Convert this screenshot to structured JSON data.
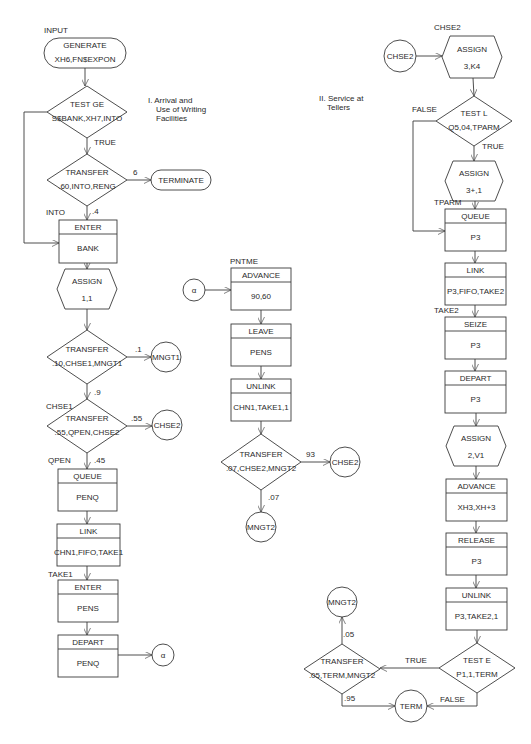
{
  "diagram": {
    "section_labels": [
      {
        "id": "sec1",
        "x": 148,
        "y": 103,
        "lines": [
          "I.  Arrival and",
          "Use of Writing",
          "Facilities"
        ]
      },
      {
        "id": "sec2",
        "x": 319,
        "y": 101,
        "lines": [
          "II.  Service at",
          "Tellers"
        ]
      }
    ],
    "block_labels": [
      {
        "text": "INPUT",
        "x": 44,
        "y": 33
      },
      {
        "text": "INTO",
        "x": 46,
        "y": 215
      },
      {
        "text": "CHSE1",
        "x": 46,
        "y": 409
      },
      {
        "text": "QPEN",
        "x": 48,
        "y": 463
      },
      {
        "text": "TAKE1",
        "x": 48,
        "y": 577
      },
      {
        "text": "PNTME",
        "x": 230,
        "y": 264
      },
      {
        "text": "CHSE2",
        "x": 434,
        "y": 30
      },
      {
        "text": "TPARM",
        "x": 434,
        "y": 205
      },
      {
        "text": "TAKE2",
        "x": 434,
        "y": 313
      }
    ],
    "nodes": [
      {
        "id": "generate",
        "type": "terminal",
        "x": 44,
        "y": 38,
        "w": 82,
        "h": 30,
        "title": "GENERATE",
        "operand": "XH6,FN$EXPON"
      },
      {
        "id": "testge",
        "type": "decision",
        "cx": 87,
        "cy": 112,
        "w": 80,
        "h": 52,
        "title": "TEST GE",
        "operand": "S$BANK,XH7,INTO"
      },
      {
        "id": "transfer1",
        "type": "decision",
        "cx": 87,
        "cy": 180,
        "w": 80,
        "h": 52,
        "title": "TRANSFER",
        "operand": ".60,INTO,RENG"
      },
      {
        "id": "terminate",
        "type": "terminal",
        "x": 151,
        "y": 170,
        "w": 60,
        "h": 20,
        "title": "TERMINATE",
        "operand": ""
      },
      {
        "id": "enter_bank",
        "type": "block",
        "x": 59,
        "y": 220,
        "w": 58,
        "h": 43,
        "title": "ENTER",
        "operand": "BANK"
      },
      {
        "id": "assign11",
        "type": "hexagon",
        "cx": 87,
        "cy": 289,
        "w": 60,
        "h": 40,
        "title": "ASSIGN",
        "operand": "1,1"
      },
      {
        "id": "transfer2",
        "type": "decision",
        "cx": 87,
        "cy": 357,
        "w": 80,
        "h": 54,
        "title": "TRANSFER",
        "operand": ".10,CHSE1,MNGT1"
      },
      {
        "id": "mngt1",
        "type": "connector",
        "cx": 166,
        "cy": 357,
        "r": 15,
        "title": "MNGT1"
      },
      {
        "id": "transfer3",
        "type": "decision",
        "cx": 87,
        "cy": 426,
        "w": 80,
        "h": 54,
        "title": "TRANSFER",
        "operand": ".55,QPEN,CHSE2"
      },
      {
        "id": "chse2_a",
        "type": "connector",
        "cx": 167,
        "cy": 425,
        "r": 15,
        "title": "CHSE2"
      },
      {
        "id": "queue_penq",
        "type": "block",
        "x": 58,
        "y": 469,
        "w": 59,
        "h": 42,
        "title": "QUEUE",
        "operand": "PENQ"
      },
      {
        "id": "link1",
        "type": "block",
        "x": 57,
        "y": 524,
        "w": 63,
        "h": 42,
        "title": "LINK",
        "operand": "CHN1,FIFO,TAKE1"
      },
      {
        "id": "enter_pens",
        "type": "block",
        "x": 58,
        "y": 580,
        "w": 60,
        "h": 42,
        "title": "ENTER",
        "operand": "PENS"
      },
      {
        "id": "depart_penq",
        "type": "block",
        "x": 58,
        "y": 635,
        "w": 60,
        "h": 42,
        "title": "DEPART",
        "operand": "PENQ"
      },
      {
        "id": "alpha_out",
        "type": "connector",
        "cx": 163,
        "cy": 655,
        "r": 11,
        "title": "α"
      },
      {
        "id": "alpha_in",
        "type": "connector",
        "cx": 194,
        "cy": 290,
        "r": 11,
        "title": "α"
      },
      {
        "id": "advance1",
        "type": "block",
        "x": 231,
        "y": 268,
        "w": 60,
        "h": 42,
        "title": "ADVANCE",
        "operand": "90,60"
      },
      {
        "id": "leave",
        "type": "block",
        "x": 231,
        "y": 324,
        "w": 60,
        "h": 42,
        "title": "LEAVE",
        "operand": "PENS"
      },
      {
        "id": "unlink1",
        "type": "block",
        "x": 231,
        "y": 379,
        "w": 60,
        "h": 42,
        "title": "UNLINK",
        "operand": "CHN1,TAKE1,1"
      },
      {
        "id": "transfer4",
        "type": "decision",
        "cx": 261,
        "cy": 462,
        "w": 80,
        "h": 56,
        "title": "TRANSFER",
        "operand": ".07,CHSE2,MNGT2"
      },
      {
        "id": "chse2_b",
        "type": "connector",
        "cx": 345,
        "cy": 462,
        "r": 15,
        "title": "CHSE2"
      },
      {
        "id": "mngt2_a",
        "type": "connector",
        "cx": 261,
        "cy": 527,
        "r": 15,
        "title": "MNGT2"
      },
      {
        "id": "chse2_in",
        "type": "connector",
        "cx": 400,
        "cy": 56,
        "r": 16,
        "title": "CHSE2"
      },
      {
        "id": "assign3k4",
        "type": "hexagon",
        "cx": 472,
        "cy": 57,
        "w": 60,
        "h": 42,
        "title": "ASSIGN",
        "operand": "3,K4"
      },
      {
        "id": "testl",
        "type": "decision",
        "cx": 474,
        "cy": 121,
        "w": 76,
        "h": 50,
        "title": "TEST L",
        "operand": "Q5,04,TPARM"
      },
      {
        "id": "assign3p1",
        "type": "hexagon",
        "cx": 474,
        "cy": 181,
        "w": 58,
        "h": 40,
        "title": "ASSIGN",
        "operand": "3+,1"
      },
      {
        "id": "queue_p3",
        "type": "block",
        "x": 445,
        "y": 209,
        "w": 61,
        "h": 42,
        "title": "QUEUE",
        "operand": "P3"
      },
      {
        "id": "link2",
        "type": "block",
        "x": 445,
        "y": 263,
        "w": 61,
        "h": 42,
        "title": "LINK",
        "operand": "P3,FIFO,TAKE2"
      },
      {
        "id": "seize",
        "type": "block",
        "x": 445,
        "y": 317,
        "w": 61,
        "h": 42,
        "title": "SEIZE",
        "operand": "P3"
      },
      {
        "id": "depart_p3",
        "type": "block",
        "x": 445,
        "y": 371,
        "w": 61,
        "h": 42,
        "title": "DEPART",
        "operand": "P3"
      },
      {
        "id": "assign2v1",
        "type": "hexagon",
        "cx": 476,
        "cy": 446,
        "w": 60,
        "h": 40,
        "title": "ASSIGN",
        "operand": "2,V1"
      },
      {
        "id": "advance2",
        "type": "block",
        "x": 446,
        "y": 479,
        "w": 61,
        "h": 42,
        "title": "ADVANCE",
        "operand": "XH3,XH+3"
      },
      {
        "id": "release",
        "type": "block",
        "x": 446,
        "y": 533,
        "w": 61,
        "h": 42,
        "title": "RELEASE",
        "operand": "P3"
      },
      {
        "id": "unlink2",
        "type": "block",
        "x": 446,
        "y": 588,
        "w": 61,
        "h": 42,
        "title": "UNLINK",
        "operand": "P3,TAKE2,1"
      },
      {
        "id": "teste",
        "type": "decision",
        "cx": 477,
        "cy": 668,
        "w": 76,
        "h": 50,
        "title": "TEST E",
        "operand": "P1,1,TERM"
      },
      {
        "id": "transfer5",
        "type": "decision",
        "cx": 342,
        "cy": 669,
        "w": 76,
        "h": 50,
        "title": "TRANSFER",
        "operand": ".05,TERM,MNGT2"
      },
      {
        "id": "mngt2_b",
        "type": "connector",
        "cx": 342,
        "cy": 602,
        "r": 15,
        "title": "MNGT2"
      },
      {
        "id": "term",
        "type": "connector",
        "cx": 411,
        "cy": 706,
        "r": 16,
        "title": "TERM"
      }
    ],
    "edge_labels": [
      {
        "text": "TRUE",
        "x": 94,
        "y": 145
      },
      {
        "text": "6",
        "x": 133,
        "y": 175
      },
      {
        "text": ".4",
        "x": 92,
        "y": 214
      },
      {
        "text": ".1",
        "x": 135,
        "y": 352
      },
      {
        "text": ".9",
        "x": 94,
        "y": 395
      },
      {
        "text": ".55",
        "x": 131,
        "y": 421
      },
      {
        "text": ".45",
        "x": 94,
        "y": 463
      },
      {
        "text": "93",
        "x": 306,
        "y": 457
      },
      {
        "text": ".07",
        "x": 268,
        "y": 500
      },
      {
        "text": "FALSE",
        "x": 412,
        "y": 112
      },
      {
        "text": "TRUE",
        "x": 482,
        "y": 149
      },
      {
        "text": "TRUE",
        "x": 405,
        "y": 663
      },
      {
        "text": "FALSE",
        "x": 440,
        "y": 702
      },
      {
        "text": ".05",
        "x": 343,
        "y": 637
      },
      {
        "text": ".95",
        "x": 344,
        "y": 701
      }
    ]
  }
}
